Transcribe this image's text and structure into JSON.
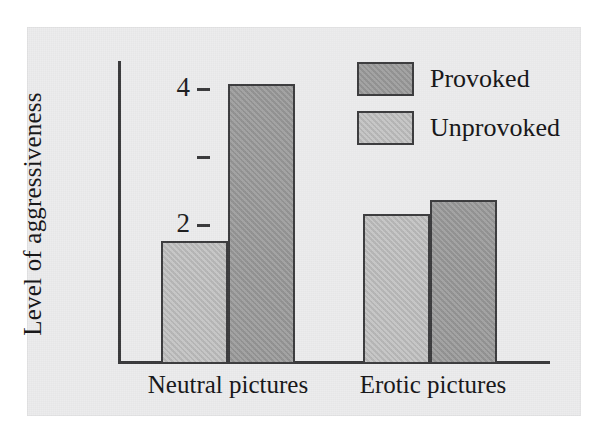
{
  "chart_data": {
    "type": "bar",
    "title": "",
    "subtitle": "",
    "xlabel": "",
    "ylabel": "Level of aggressiveness",
    "categories": [
      "Neutral pictures",
      "Erotic pictures"
    ],
    "series": [
      {
        "name": "Unprovoked",
        "color": "#bdbdbd",
        "values": [
          1.8,
          2.2
        ]
      },
      {
        "name": "Provoked",
        "color": "#9a9a9a",
        "values": [
          4.1,
          2.4
        ]
      }
    ],
    "bar_order_within_group": [
      "Unprovoked",
      "Provoked"
    ],
    "ylim": [
      0,
      4.55
    ],
    "y_ticks": [
      1,
      2,
      3,
      4
    ],
    "y_tick_labels": [
      "",
      "2",
      "",
      "4"
    ],
    "grid": false,
    "legend_position": "top-right",
    "legend_entries": [
      "Provoked",
      "Unprovoked"
    ],
    "annotations": []
  },
  "figure": {
    "panel_background": "#ececed",
    "axis_color": "#3a3a3c",
    "text_color": "#161618"
  }
}
